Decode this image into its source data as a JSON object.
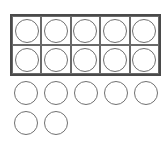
{
  "ten_frame": {
    "rows": 2,
    "columns": 5,
    "filled_cells": 10
  },
  "extra_counters": {
    "rows": [
      5,
      2
    ],
    "count": 7
  },
  "total_counters": 17,
  "colors": {
    "frame_border": "#4a4a4a",
    "counter_stroke": "#707070",
    "background": "#ffffff"
  }
}
